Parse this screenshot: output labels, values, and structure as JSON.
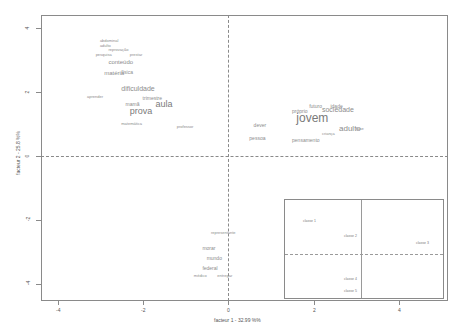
{
  "chart_data": {
    "type": "scatter",
    "subtype": "correspondence-analysis word plot",
    "title": "",
    "xlabel": "facteur 1 - 32.99 %%",
    "ylabel": "facteur 2 - 25.8 %%",
    "xlim": [
      -4.4,
      5.2
    ],
    "ylim": [
      -4.4,
      4.4
    ],
    "x_ticks": [
      "-4",
      "-2",
      "0",
      "2",
      "4"
    ],
    "y_ticks": [
      "4",
      "2",
      "0",
      "-2",
      "-4"
    ],
    "grid": false,
    "reference_lines": {
      "x": 0,
      "y": 0,
      "style": "dashed"
    },
    "words": [
      {
        "text": "abdominal",
        "x": -3.0,
        "y": 3.6,
        "size": 4
      },
      {
        "text": "adulto",
        "x": -3.0,
        "y": 3.45,
        "size": 4
      },
      {
        "text": "reprovação",
        "x": -2.8,
        "y": 3.3,
        "size": 4
      },
      {
        "text": "pesquisa",
        "x": -3.1,
        "y": 3.15,
        "size": 4
      },
      {
        "text": "prestar",
        "x": -2.3,
        "y": 3.15,
        "size": 4
      },
      {
        "text": "conteúdo",
        "x": -2.8,
        "y": 2.95,
        "size": 6
      },
      {
        "text": "física",
        "x": -2.5,
        "y": 2.6,
        "size": 5
      },
      {
        "text": "matéria",
        "x": -2.9,
        "y": 2.6,
        "size": 6
      },
      {
        "text": "dificuldade",
        "x": -2.5,
        "y": 2.1,
        "size": 7
      },
      {
        "text": "aprender",
        "x": -3.3,
        "y": 1.85,
        "size": 4
      },
      {
        "text": "trimestre",
        "x": -2.0,
        "y": 1.8,
        "size": 5
      },
      {
        "text": "mamã",
        "x": -2.4,
        "y": 1.6,
        "size": 5
      },
      {
        "text": "aula",
        "x": -1.7,
        "y": 1.6,
        "size": 9
      },
      {
        "text": "prova",
        "x": -2.3,
        "y": 1.38,
        "size": 9
      },
      {
        "text": "matemática",
        "x": -2.5,
        "y": 1.0,
        "size": 4
      },
      {
        "text": "professor",
        "x": -1.2,
        "y": 0.9,
        "size": 4
      },
      {
        "text": "sociedade",
        "x": 2.2,
        "y": 1.45,
        "size": 7
      },
      {
        "text": "jovem",
        "x": 1.6,
        "y": 1.2,
        "size": 12
      },
      {
        "text": "adulto",
        "x": 2.6,
        "y": 0.85,
        "size": 8
      },
      {
        "text": "futuro",
        "x": 1.9,
        "y": 1.55,
        "size": 5
      },
      {
        "text": "idade",
        "x": 2.4,
        "y": 1.55,
        "size": 5
      },
      {
        "text": "próprio",
        "x": 1.5,
        "y": 1.4,
        "size": 5
      },
      {
        "text": "dever",
        "x": 0.6,
        "y": 0.95,
        "size": 5
      },
      {
        "text": "pessoa",
        "x": 0.5,
        "y": 0.55,
        "size": 5
      },
      {
        "text": "pensamento",
        "x": 1.5,
        "y": 0.5,
        "size": 5
      },
      {
        "text": "criança",
        "x": 2.2,
        "y": 0.7,
        "size": 4
      },
      {
        "text": "fase",
        "x": 3.0,
        "y": 0.85,
        "size": 4
      },
      {
        "text": "mundo",
        "x": -0.5,
        "y": -3.2,
        "size": 5
      },
      {
        "text": "morar",
        "x": -0.6,
        "y": -2.9,
        "size": 5
      },
      {
        "text": "federal",
        "x": -0.6,
        "y": -3.5,
        "size": 5
      },
      {
        "text": "médico",
        "x": -0.8,
        "y": -3.75,
        "size": 4
      },
      {
        "text": "entregar",
        "x": -0.25,
        "y": -3.75,
        "size": 4
      },
      {
        "text": "representante",
        "x": -0.4,
        "y": -2.4,
        "size": 4
      }
    ],
    "inset": {
      "description": "class (classe) positions on factors 1 and 2",
      "points": [
        {
          "label": "classe 1",
          "quadrant_pos": [
            0.14,
            0.2
          ]
        },
        {
          "label": "classe 2",
          "quadrant_pos": [
            0.45,
            0.4
          ]
        },
        {
          "label": "classe 3",
          "quadrant_pos": [
            0.92,
            0.46
          ]
        },
        {
          "label": "classe 4",
          "quadrant_pos": [
            0.45,
            0.8
          ]
        },
        {
          "label": "classe 5",
          "quadrant_pos": [
            0.45,
            0.92
          ]
        }
      ]
    }
  },
  "axes": {
    "x_title": "facteur 1 - 32.99 %%",
    "y_title": "facteur 2 - 25.8 %%",
    "y_ticks": [
      {
        "label": "4",
        "top": 28
      },
      {
        "label": "2",
        "top": 92
      },
      {
        "label": "0",
        "top": 156
      },
      {
        "label": "-2",
        "top": 220
      },
      {
        "label": "-4",
        "top": 284
      }
    ],
    "x_ticks": [
      {
        "label": "-4",
        "left": 58
      },
      {
        "label": "-2",
        "left": 143
      },
      {
        "label": "0",
        "left": 228
      },
      {
        "label": "2",
        "left": 314
      },
      {
        "label": "4",
        "left": 399
      }
    ]
  },
  "inset_labels": [
    "classe 1",
    "classe 2",
    "classe 3",
    "classe 4",
    "classe 5"
  ]
}
